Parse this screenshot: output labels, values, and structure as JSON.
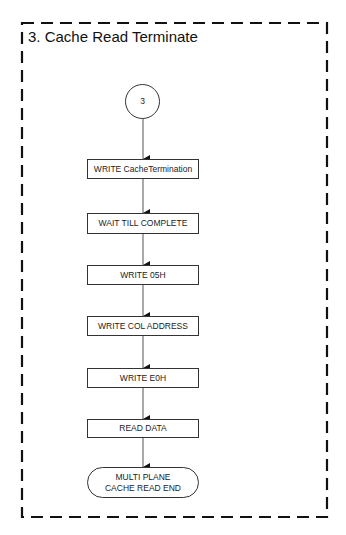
{
  "diagram": {
    "title": "3. Cache Read Terminate",
    "start_connector": {
      "label": "3"
    },
    "steps": [
      {
        "label": "WRITE CacheTermination"
      },
      {
        "label": "WAIT TILL COMPLETE"
      },
      {
        "label": "WRITE 05H"
      },
      {
        "label": "WRITE COL ADDRESS"
      },
      {
        "label": "WRITE E0H"
      },
      {
        "label": "READ DATA"
      }
    ],
    "end_terminal": {
      "label": "MULTI PLANE CACHE READ END"
    },
    "colors": {
      "border": "#111111",
      "stroke": "#333333",
      "text": "#222222"
    }
  }
}
